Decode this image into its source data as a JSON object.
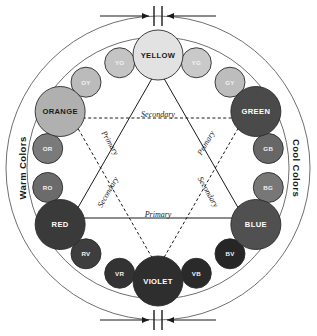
{
  "figure": {
    "bands": {
      "warm_label": "Warm Colors",
      "cool_label": "Cool Colors"
    },
    "guides": {
      "primary_top": "Primary",
      "primary_left": "Primary",
      "primary_right": "Primary",
      "secondary_top": "Secondary",
      "secondary_left": "Secondary",
      "secondary_right": "Secondary"
    },
    "colors": {
      "background": "#ffffff",
      "outline": "#6f6f6f",
      "ink": "#1a1a1a",
      "swatch_stroke": "#2b2b2b"
    }
  },
  "swatches": {
    "primaries_secondaries": [
      {
        "label": "YELLOW",
        "angle": 90,
        "fill": "#e2e2e2",
        "text": "#1a1a1a",
        "role": "primary"
      },
      {
        "label": "GREEN",
        "angle": 30,
        "fill": "#4a4a4a",
        "text": "#ffffff",
        "role": "secondary"
      },
      {
        "label": "BLUE",
        "angle": 330,
        "fill": "#505050",
        "text": "#ffffff",
        "role": "primary"
      },
      {
        "label": "VIOLET",
        "angle": 270,
        "fill": "#2e2e2e",
        "text": "#ffffff",
        "role": "secondary"
      },
      {
        "label": "RED",
        "angle": 210,
        "fill": "#3a3a3a",
        "text": "#ffffff",
        "role": "primary"
      },
      {
        "label": "ORANGE",
        "angle": 150,
        "fill": "#b0b0b0",
        "text": "#1a1a1a",
        "role": "secondary"
      }
    ],
    "tertiaries": [
      {
        "label": "YG",
        "angle": 70,
        "fill": "#c9c9c9",
        "text": "#f2f2f2"
      },
      {
        "label": "GY",
        "angle": 50,
        "fill": "#bdbdbd",
        "text": "#f2f2f2"
      },
      {
        "label": "GB",
        "angle": 10,
        "fill": "#676767",
        "text": "#f2f2f2"
      },
      {
        "label": "BG",
        "angle": 350,
        "fill": "#777777",
        "text": "#f2f2f2"
      },
      {
        "label": "BV",
        "angle": 310,
        "fill": "#262626",
        "text": "#f2f2f2"
      },
      {
        "label": "VB",
        "angle": 290,
        "fill": "#2a2a2a",
        "text": "#f2f2f2"
      },
      {
        "label": "VR",
        "angle": 250,
        "fill": "#333333",
        "text": "#f2f2f2"
      },
      {
        "label": "RV",
        "angle": 230,
        "fill": "#3e3e3e",
        "text": "#f2f2f2"
      },
      {
        "label": "RO",
        "angle": 190,
        "fill": "#6b6b6b",
        "text": "#f2f2f2"
      },
      {
        "label": "OR",
        "angle": 170,
        "fill": "#7a7a7a",
        "text": "#f2f2f2"
      },
      {
        "label": "OY",
        "angle": 130,
        "fill": "#bbbbbb",
        "text": "#f2f2f2"
      },
      {
        "label": "YO",
        "angle": 110,
        "fill": "#c4c4c4",
        "text": "#f2f2f2"
      }
    ]
  }
}
